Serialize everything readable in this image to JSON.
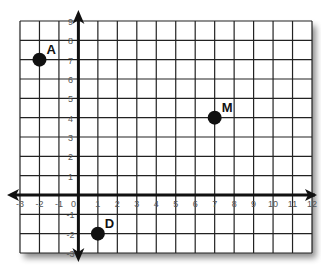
{
  "chart_data": {
    "type": "scatter",
    "title": "",
    "xlabel": "",
    "ylabel": "",
    "xlim": [
      -3,
      12
    ],
    "ylim": [
      -3,
      9
    ],
    "grid": true,
    "x_ticks": [
      -3,
      -2,
      -1,
      0,
      1,
      2,
      3,
      4,
      5,
      6,
      7,
      8,
      9,
      10,
      11,
      12
    ],
    "y_ticks": [
      -3,
      -2,
      -1,
      0,
      1,
      2,
      3,
      4,
      5,
      6,
      7,
      8,
      9
    ],
    "points": [
      {
        "label": "A",
        "x": -2,
        "y": 7
      },
      {
        "label": "M",
        "x": 7,
        "y": 4
      },
      {
        "label": "D",
        "x": 1,
        "y": -2
      }
    ]
  },
  "colors": {
    "grid": "#222222",
    "axis": "#111111",
    "point": "#111111",
    "tick_text": "#555555"
  }
}
